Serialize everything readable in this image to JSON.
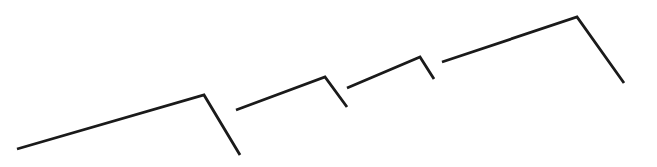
{
  "figure": {
    "background_color": "#ffffff",
    "width": 657,
    "height": 167,
    "stroke_color": "#1a1a1a",
    "stroke_width": 2.8
  },
  "chart_data": {
    "type": "line",
    "subtitle": "",
    "xlabel": "",
    "ylabel": "",
    "xlim": [
      0,
      657
    ],
    "ylim": [
      167,
      0
    ],
    "grid": false,
    "legend": "none",
    "axes_visible": false,
    "tick_labels_x": [],
    "tick_labels_y": [],
    "annotations": [],
    "series": [
      {
        "name": "stroke-1",
        "points": [
          {
            "x": 17,
            "y": 149
          },
          {
            "x": 204,
            "y": 95
          },
          {
            "x": 240,
            "y": 155
          }
        ]
      },
      {
        "name": "stroke-2",
        "points": [
          {
            "x": 236,
            "y": 110
          },
          {
            "x": 325,
            "y": 77
          },
          {
            "x": 347,
            "y": 107
          }
        ]
      },
      {
        "name": "stroke-3",
        "points": [
          {
            "x": 347,
            "y": 88
          },
          {
            "x": 420,
            "y": 57
          },
          {
            "x": 434,
            "y": 79
          }
        ]
      },
      {
        "name": "stroke-4",
        "points": [
          {
            "x": 442,
            "y": 62
          },
          {
            "x": 577,
            "y": 17
          },
          {
            "x": 624,
            "y": 83
          }
        ]
      }
    ]
  }
}
